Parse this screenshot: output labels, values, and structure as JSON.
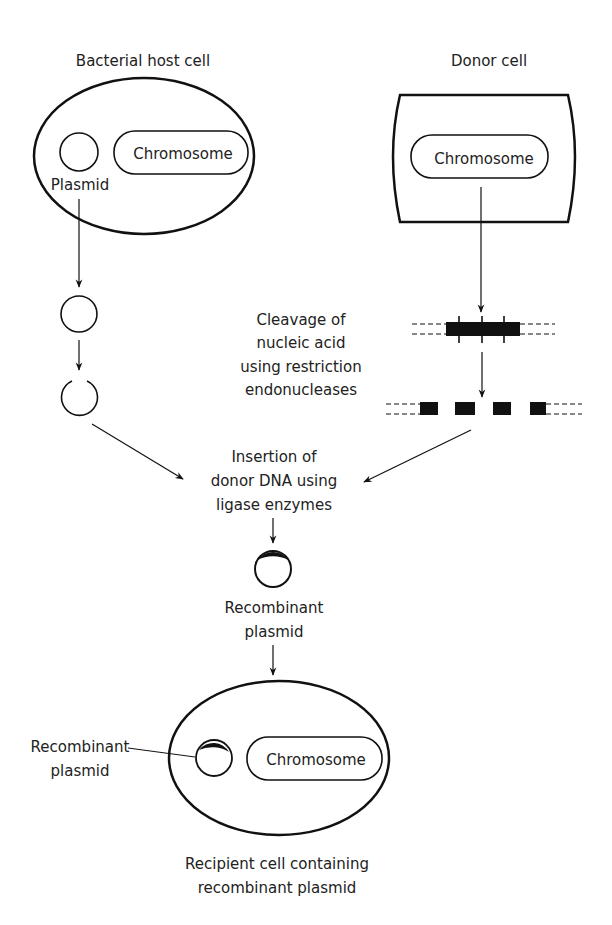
{
  "diagram": {
    "labels": {
      "host_cell_title": "Bacterial host cell",
      "donor_cell_title": "Donor cell",
      "host_chromosome": "Chromosome",
      "host_plasmid": "Plasmid",
      "donor_chromosome": "Chromosome",
      "cleavage": [
        "Cleavage of",
        "nucleic acid",
        "using restriction",
        "endonucleases"
      ],
      "insertion": [
        "Insertion of",
        "donor DNA using",
        "ligase enzymes"
      ],
      "recombinant_plasmid": [
        "Recombinant",
        "plasmid"
      ],
      "recipient_plasmid_label": [
        "Recombinant",
        "plasmid"
      ],
      "recipient_chromosome": "Chromosome",
      "recipient_caption": [
        "Recipient cell containing",
        "recombinant plasmid"
      ]
    },
    "colors": {
      "line": "#111111",
      "text": "#222222",
      "background": "#ffffff"
    }
  }
}
